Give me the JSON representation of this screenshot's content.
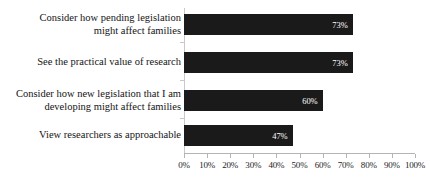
{
  "chart_data": {
    "type": "bar",
    "orientation": "horizontal",
    "title": "",
    "xlabel": "",
    "ylabel": "",
    "xlim": [
      0,
      100
    ],
    "grid": false,
    "legend": false,
    "value_suffix": "%",
    "categories": [
      "Consider how pending legislation\nmight affect families",
      "See the practical value of research",
      "Consider how new legislation that I am\ndeveloping might affect families",
      "View researchers as approachable"
    ],
    "values": [
      73,
      73,
      60,
      47
    ],
    "value_labels": [
      "73%",
      "73%",
      "60%",
      "47%"
    ],
    "xticks": [
      0,
      10,
      20,
      30,
      40,
      50,
      60,
      70,
      80,
      90,
      100
    ],
    "xtick_labels": [
      "0%",
      "10%",
      "20%",
      "30%",
      "40%",
      "50%",
      "60%",
      "70%",
      "80%",
      "90%",
      "100%"
    ],
    "colors": {
      "bar": "#1a1a1a",
      "bar_label_text": "#ffffff",
      "axis": "#b4b4b4",
      "category_axis": "#c9c9c9",
      "tick_text": "#1d1d1d",
      "category_text": "#141414",
      "background": "#ffffff"
    }
  }
}
